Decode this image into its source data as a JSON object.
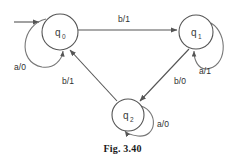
{
  "figure": {
    "caption": "Fig. 3.40",
    "type": "mealy-state-transition-diagram"
  },
  "diagram": {
    "states": [
      {
        "id": "q0",
        "label": "q",
        "subscript": "0",
        "cx": 60,
        "cy": 32,
        "r": 18,
        "initial": true
      },
      {
        "id": "q1",
        "label": "q",
        "subscript": "1",
        "cx": 196,
        "cy": 32,
        "r": 17,
        "initial": false
      },
      {
        "id": "q2",
        "label": "q",
        "subscript": "2",
        "cx": 128,
        "cy": 115,
        "r": 16,
        "initial": false
      }
    ],
    "transitions": [
      {
        "from": "q0",
        "to": "q1",
        "input": "b",
        "output": "1",
        "label": "b/1",
        "label_x": 124,
        "label_y": 22
      },
      {
        "from": "q0",
        "to": "q0",
        "input": "a",
        "output": "0",
        "label": "a/0",
        "label_x": 20,
        "label_y": 70,
        "self_loop": true
      },
      {
        "from": "q1",
        "to": "q1",
        "input": "a",
        "output": "1",
        "label": "a/1",
        "label_x": 205,
        "label_y": 74,
        "self_loop": true
      },
      {
        "from": "q2",
        "to": "q2",
        "input": "a",
        "output": "0",
        "label": "a/0",
        "label_x": 163,
        "label_y": 127,
        "self_loop": true
      },
      {
        "from": "q1",
        "to": "q2",
        "input": "b",
        "output": "0",
        "label": "b/0",
        "label_x": 180,
        "label_y": 84
      },
      {
        "from": "q2",
        "to": "q0",
        "input": "b",
        "output": "1",
        "label": "b/1",
        "label_x": 68,
        "label_y": 84
      }
    ],
    "initial_arrow": {
      "from_x": 14,
      "to_x": 41,
      "y": 22
    },
    "colors": {
      "stroke": "#555555",
      "loop_stroke": "#777777",
      "text": "#2f2f2f",
      "background": "#ffffff"
    }
  }
}
